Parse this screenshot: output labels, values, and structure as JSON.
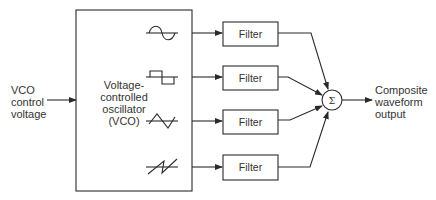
{
  "input": {
    "label_lines": [
      "VCO",
      "control",
      "voltage"
    ]
  },
  "vco": {
    "label_lines": [
      "Voltage-",
      "controlled",
      "oscillator",
      "(VCO)"
    ]
  },
  "waveforms": [
    {
      "name": "sine",
      "icon": "sine-wave-icon"
    },
    {
      "name": "square",
      "icon": "square-wave-icon"
    },
    {
      "name": "triangle",
      "icon": "triangle-wave-icon"
    },
    {
      "name": "sawtooth",
      "icon": "sawtooth-wave-icon"
    }
  ],
  "filters": [
    {
      "label": "Filter"
    },
    {
      "label": "Filter"
    },
    {
      "label": "Filter"
    },
    {
      "label": "Filter"
    }
  ],
  "summer": {
    "symbol": "Σ"
  },
  "output": {
    "label_lines": [
      "Composite",
      "waveform",
      "output"
    ]
  },
  "colors": {
    "line": "#2a2a2a",
    "background": "#ffffff"
  }
}
